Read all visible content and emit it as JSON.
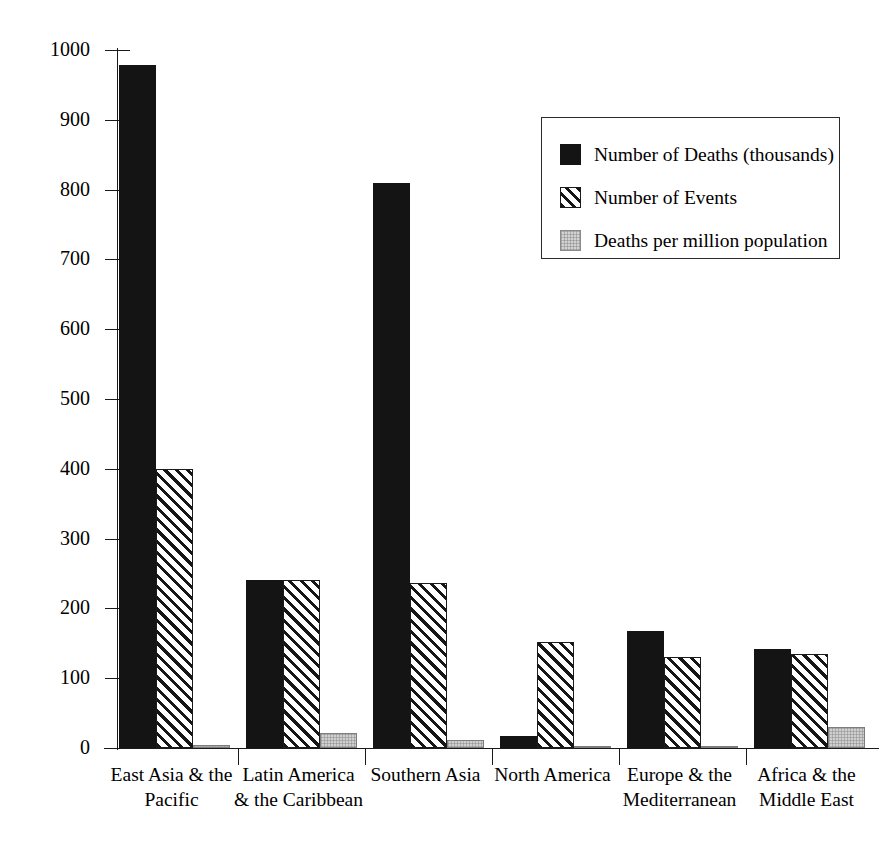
{
  "chart_data": {
    "type": "bar",
    "title": "",
    "subtitle": "",
    "xlabel": "",
    "ylabel": "",
    "ylim": [
      0,
      1000
    ],
    "yticks": [
      0,
      100,
      200,
      300,
      400,
      500,
      600,
      700,
      800,
      900,
      1000
    ],
    "grid": false,
    "legend_position": "upper-right",
    "categories": [
      "East Asia & the\nPacific",
      "Latin America\n& the Caribbean",
      "Southern Asia",
      "North America",
      "Europe & the\nMediterranean",
      "Africa & the\nMiddle East"
    ],
    "series": [
      {
        "name": "Number of Deaths (thousands)",
        "style": "solid",
        "color": "#141414",
        "values": [
          978,
          240,
          810,
          17,
          168,
          142
        ]
      },
      {
        "name": "Number of Events",
        "style": "hatch",
        "color": "#161616",
        "values": [
          400,
          240,
          237,
          152,
          130,
          135
        ]
      },
      {
        "name": "Deaths per million population",
        "style": "gray",
        "color": "#cfcfcf",
        "values": [
          5,
          22,
          12,
          2,
          3,
          30
        ]
      }
    ]
  },
  "legend": {
    "items": [
      {
        "label": "Number of Deaths (thousands)",
        "style": "solid"
      },
      {
        "label": "Number of Events",
        "style": "hatch"
      },
      {
        "label": "Deaths per million population",
        "style": "gray"
      }
    ]
  },
  "axis": {
    "y_tick_labels": [
      "1000",
      "900",
      "800",
      "700",
      "600",
      "500",
      "400",
      "300",
      "200",
      "100",
      "0"
    ]
  }
}
